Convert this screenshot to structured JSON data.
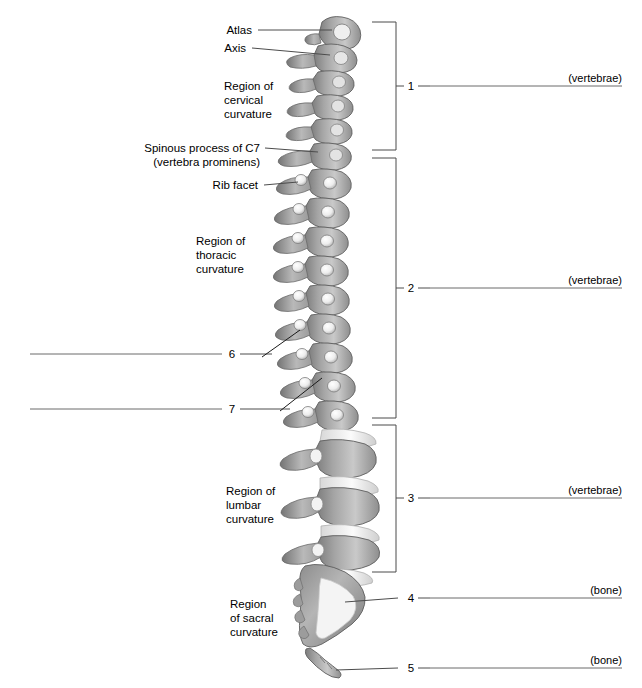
{
  "figure": {
    "background": "#ffffff",
    "bone_light": "#e8e8e8",
    "bone_mid": "#a8a8a8",
    "bone_dark": "#6f6f6f",
    "line_color": "#4c4c4c"
  },
  "left_labels": [
    {
      "id": "atlas",
      "text": "Atlas"
    },
    {
      "id": "axis",
      "text": "Axis"
    },
    {
      "id": "spinous-c7-line1",
      "text": "Spinous process of C7"
    },
    {
      "id": "spinous-c7-line2",
      "text": "(vertebra prominens)"
    },
    {
      "id": "rib-facet",
      "text": "Rib facet"
    }
  ],
  "region_labels": [
    {
      "id": "cervical",
      "lines": [
        "Region of",
        "cervical",
        "curvature"
      ]
    },
    {
      "id": "thoracic",
      "lines": [
        "Region of",
        "thoracic",
        "curvature"
      ]
    },
    {
      "id": "lumbar",
      "lines": [
        "Region of",
        "lumbar",
        "curvature"
      ]
    },
    {
      "id": "sacral",
      "lines": [
        "Region",
        "of sacral",
        "curvature"
      ]
    }
  ],
  "numbered_callouts": [
    {
      "number": "1",
      "hint": "(vertebrae)",
      "side": "right",
      "style": "bracket",
      "answer": ""
    },
    {
      "number": "2",
      "hint": "(vertebrae)",
      "side": "right",
      "style": "bracket",
      "answer": ""
    },
    {
      "number": "3",
      "hint": "(vertebrae)",
      "side": "right",
      "style": "bracket",
      "answer": ""
    },
    {
      "number": "4",
      "hint": "(bone)",
      "side": "right",
      "style": "leader",
      "answer": ""
    },
    {
      "number": "5",
      "hint": "(bone)",
      "side": "right",
      "style": "leader",
      "answer": ""
    },
    {
      "number": "6",
      "hint": "",
      "side": "left",
      "style": "leader",
      "answer": ""
    },
    {
      "number": "7",
      "hint": "",
      "side": "left",
      "style": "leader",
      "answer": ""
    }
  ]
}
